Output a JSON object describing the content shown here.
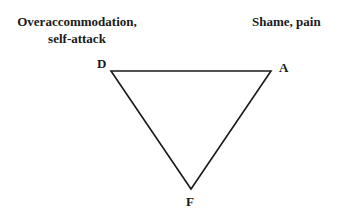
{
  "labels": {
    "top_left_line1": "Overaccommodation,",
    "top_left_line2": "self-attack",
    "top_right": "Shame, pain"
  },
  "vertices": {
    "d": "D",
    "a": "A",
    "f": "F"
  },
  "triangle": {
    "points": [
      [
        111,
        71
      ],
      [
        271,
        71
      ],
      [
        191,
        189
      ]
    ],
    "stroke": "#1a1a1a"
  }
}
